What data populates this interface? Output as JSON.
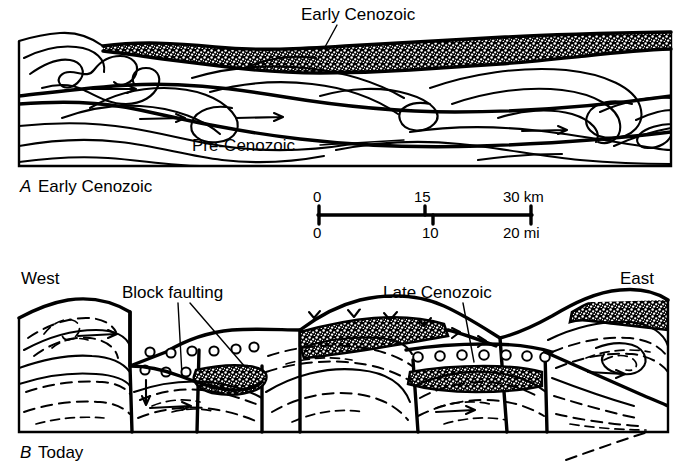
{
  "figure": {
    "type": "geologic-cross-section",
    "caption_a": {
      "letter": "A",
      "text": "Early Cenozoic"
    },
    "caption_b": {
      "letter": "B",
      "text": "Today"
    },
    "panel_a": {
      "labels": {
        "sediment": "Early Cenozoic",
        "basement": "Pre-Cenozoic"
      }
    },
    "panel_b": {
      "labels": {
        "west": "West",
        "east": "East",
        "block_faulting": "Block faulting",
        "late_cenozoic": "Late Cenozoic"
      }
    },
    "scale_bar": {
      "km": {
        "unit": "km",
        "ticks": [
          "0",
          "15",
          "30"
        ],
        "max": 30
      },
      "mi": {
        "unit": "mi",
        "ticks": [
          "0",
          "10",
          "20"
        ],
        "max": 20
      },
      "km_label": "30 km",
      "mi_label": "20 mi"
    },
    "colors": {
      "ink": "#000000",
      "paper": "#ffffff"
    }
  }
}
